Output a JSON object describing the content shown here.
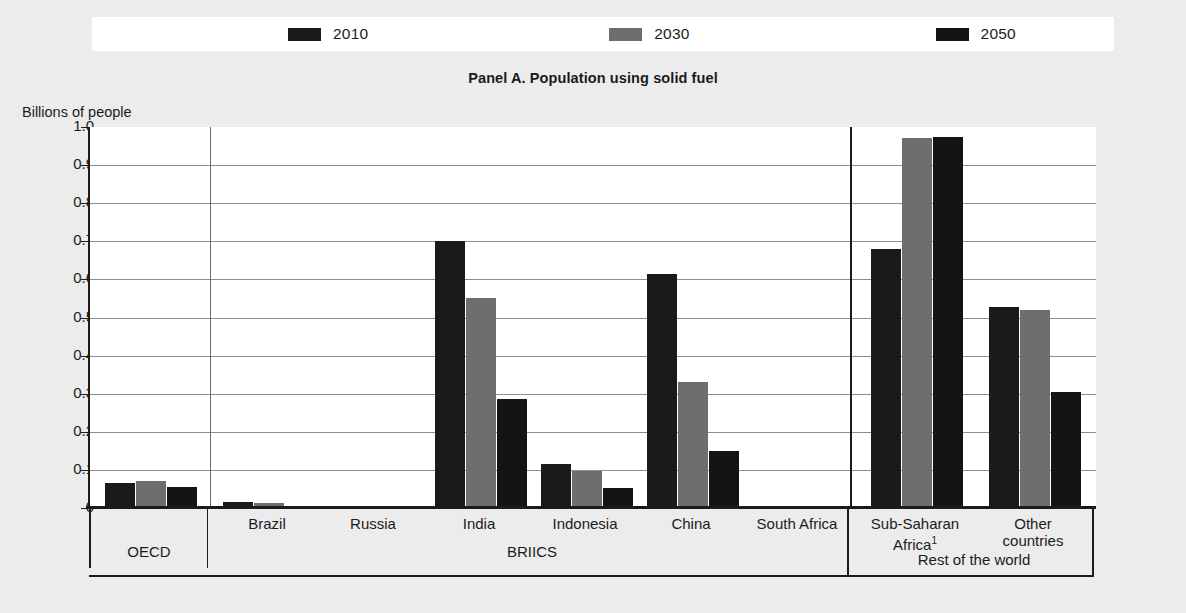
{
  "panel": {
    "title": "Panel A. Population using solid fuel",
    "axis_title": "Billions of people"
  },
  "legend": {
    "items": [
      {
        "label": "2010",
        "color": "#1a1a1a"
      },
      {
        "label": "2030",
        "color": "#6e6e6e"
      },
      {
        "label": "2050",
        "color": "#141414"
      }
    ]
  },
  "colors": {
    "series_2010": "#1a1a1a",
    "series_2030": "#6e6e6e",
    "series_2050": "#141414",
    "grid": "#8e8e90",
    "axis": "#1b1b1b",
    "plot_background": "#ffffff",
    "page_background": "#ececed"
  },
  "yaxis": {
    "labels": [
      "1.0",
      "0.9",
      "0.8",
      "0.7",
      "0.6",
      "0.5",
      "0.4",
      "0.3",
      "0.2",
      "0.1",
      "0"
    ],
    "min": 0,
    "max": 1.0,
    "step": 0.1
  },
  "groups": [
    {
      "label": "OECD",
      "categories": [
        "OECD"
      ]
    },
    {
      "label": "BRIICS",
      "categories": [
        "Brazil",
        "Russia",
        "India",
        "Indonesia",
        "China",
        "South Africa"
      ]
    },
    {
      "label": "Rest of the world",
      "categories": [
        "Sub-Saharan Africa¹",
        "Other countries"
      ]
    }
  ],
  "footnote_marker": "1",
  "chart_data": {
    "type": "bar",
    "title": "Panel A. Population using solid fuel",
    "xlabel": "",
    "ylabel": "Billions of people",
    "ylim": [
      0,
      1.0
    ],
    "ytick_step": 0.1,
    "grid": true,
    "legend_position": "top",
    "categories": [
      "OECD",
      "Brazil",
      "Russia",
      "India",
      "Indonesia",
      "China",
      "South Africa",
      "Sub-Saharan Africa",
      "Other countries"
    ],
    "group_labels": [
      "OECD",
      "BRIICS",
      "Rest of the world"
    ],
    "group_spans": [
      [
        0,
        0
      ],
      [
        1,
        6
      ],
      [
        7,
        8
      ]
    ],
    "series": [
      {
        "name": "2010",
        "color": "#1a1a1a",
        "values": [
          0.065,
          0.017,
          0.006,
          0.7,
          0.115,
          0.615,
          0.006,
          0.68,
          0.528
        ]
      },
      {
        "name": "2030",
        "color": "#6e6e6e",
        "values": [
          0.072,
          0.014,
          0.0,
          0.55,
          0.098,
          0.33,
          0.003,
          0.97,
          0.52
        ]
      },
      {
        "name": "2050",
        "color": "#141414",
        "values": [
          0.055,
          0.004,
          0.0,
          0.285,
          0.053,
          0.15,
          0.001,
          0.975,
          0.305
        ]
      }
    ]
  }
}
